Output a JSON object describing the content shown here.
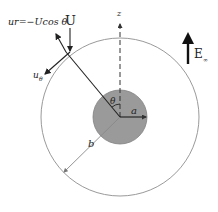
{
  "diagram": {
    "labels": {
      "ur_expression": "ur=−Ucos θ",
      "velocity": "U",
      "z_axis": "z",
      "field": "E",
      "field_subscript": "∞",
      "u_theta": "u",
      "u_theta_subscript": "θ",
      "theta": "θ",
      "inner_radius": "a",
      "outer_radius": "b"
    },
    "colors": {
      "sphere_fill": "#9a9a9a",
      "sphere_stroke": "#7a7a7a",
      "outer_circle": "#999999",
      "arrows": "#222222"
    },
    "geometry": {
      "center": [
        120,
        117
      ],
      "inner_radius_px": 27,
      "outer_radius_px": 79
    }
  }
}
